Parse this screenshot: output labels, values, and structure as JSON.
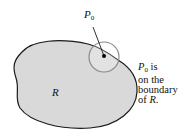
{
  "diagram": {
    "point_label": "P",
    "point_subscript": "0",
    "region_label": "R",
    "note": {
      "line1_symbol": "P",
      "line1_subscript": "0",
      "line1_rest": " is",
      "line2": "on the",
      "line3": "boundary",
      "line4_prefix": "of ",
      "line4_symbol": "R",
      "line4_suffix": "."
    },
    "colors": {
      "region_fill": "#d9d9d9",
      "region_stroke": "#1a1a1a",
      "circle_stroke": "#8a8a8a",
      "point": "#000000"
    }
  }
}
